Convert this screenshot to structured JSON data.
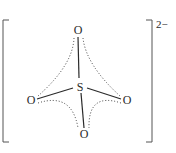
{
  "diagram": {
    "central_atom": "S",
    "ligands": [
      {
        "id": "top",
        "label": "O"
      },
      {
        "id": "left",
        "label": "O"
      },
      {
        "id": "right",
        "label": "O"
      },
      {
        "id": "bottom",
        "label": "O"
      }
    ],
    "charge": "2−"
  }
}
